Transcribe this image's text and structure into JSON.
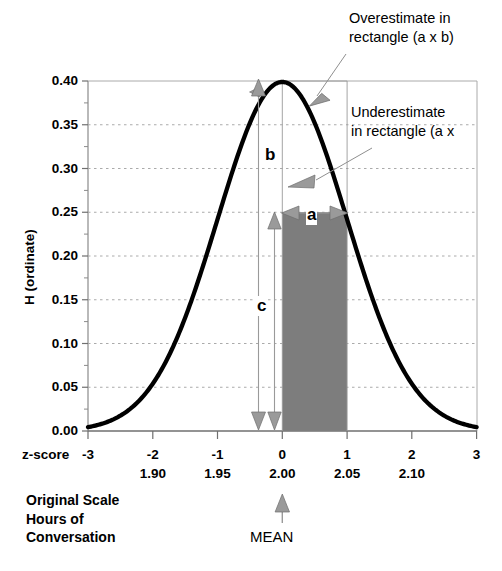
{
  "chart_data": {
    "type": "line",
    "title": "",
    "subtitle": "",
    "xlabel": "z-score",
    "ylabel": "H (ordinate)",
    "xlim": [
      -3,
      3
    ],
    "ylim": [
      0.0,
      0.4
    ],
    "grid": true,
    "legend_position": "none",
    "curve_name": "standard normal density",
    "curve_formula_note": "H = (1/sqrt(2*pi)) * exp(-z^2/2)",
    "x_ticks": [
      "-3",
      "-2",
      "-1",
      "0",
      "1",
      "2",
      "3"
    ],
    "x_tick_values": [
      -3,
      -2,
      -1,
      0,
      1,
      2,
      3
    ],
    "x_secondary_axis_label": "Original Scale Hours of Conversation",
    "x_secondary_ticks": [
      "",
      "1.90",
      "1.95",
      "2.00",
      "2.05",
      "2.10",
      ""
    ],
    "x_secondary_tick_values": [
      null,
      1.9,
      1.95,
      2.0,
      2.05,
      2.1,
      null
    ],
    "y_ticks": [
      "0.40",
      "0.35",
      "0.30",
      "0.25",
      "0.20",
      "0.15",
      "0.10",
      "0.05",
      "0.00"
    ],
    "y_tick_values": [
      0.4,
      0.35,
      0.3,
      0.25,
      0.2,
      0.15,
      0.1,
      0.05,
      0.0
    ],
    "y_minor_tick_step": 0.025,
    "shaded_region": {
      "name": "rectangle (a x c)",
      "x_start": 0,
      "x_end": 1,
      "y_bottom": 0.0,
      "y_top": 0.25,
      "fill_color": "#808080"
    },
    "markers": {
      "a_label": "a",
      "a_description": "width of rectangle, z = 0 to z = 1",
      "a_value": 1.0,
      "b_label": "b",
      "b_description": "ordinate height at z = 0 (peak)",
      "b_value": 0.3989,
      "c_label": "c",
      "c_description": "ordinate height at z = 1 (rectangle height)",
      "c_value": 0.242
    },
    "annotations": [
      {
        "name": "overestimate-callout",
        "lines": [
          "Overestimate in",
          "rectangle (a x b)"
        ],
        "points_to_z": 0.45,
        "points_to_h": 0.375
      },
      {
        "name": "underestimate-callout",
        "lines": [
          "Underestimate",
          "in rectangle (a x"
        ],
        "points_to_z": 0.62,
        "points_to_h": 0.295
      },
      {
        "name": "mean-marker",
        "lines": [
          "MEAN"
        ],
        "points_to_z": 0,
        "points_to_h": 0
      }
    ]
  },
  "labels": {
    "overestimate_line1": "Overestimate in",
    "overestimate_line2": "rectangle (a x b)",
    "underestimate_line1": "Underestimate",
    "underestimate_line2": "in rectangle (a x",
    "y_axis_title": "H (ordinate)",
    "z_score_caption": "z-score",
    "original_scale_line1": "Original Scale",
    "original_scale_line2": "Hours of",
    "original_scale_line3": "Conversation",
    "mean": "MEAN",
    "letter_a": "a",
    "letter_b": "b",
    "letter_c": "c",
    "y0": "0.40",
    "y1": "0.35",
    "y2": "0.30",
    "y3": "0.25",
    "y4": "0.20",
    "y5": "0.15",
    "y6": "0.10",
    "y7": "0.05",
    "y8": "0.00",
    "xm3": "-3",
    "xm2": "-2",
    "xm1": "-1",
    "x0": "0",
    "x1": "1",
    "x2": "2",
    "x3": "3",
    "o190": "1.90",
    "o195": "1.95",
    "o200": "2.00",
    "o205": "2.05",
    "o210": "2.10"
  },
  "colors": {
    "curve": "#000000",
    "shaded_rect": "#808080",
    "arrow_gray": "#9a9a9a",
    "gridline": "#aaaaaa",
    "axis": "#999999",
    "text": "#000000",
    "background": "#ffffff"
  }
}
